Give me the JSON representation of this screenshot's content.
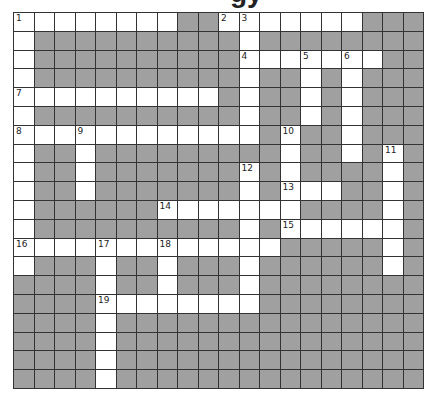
{
  "title": "gy",
  "colors": {
    "block": "#a0a0a0",
    "open": "#ffffff",
    "grid_line": "#333333"
  },
  "grid": {
    "rows": 20,
    "cols": 20,
    "layout": [
      "########..#######...",
      "#..........#........",
      "#..........#######..",
      "#..........#..#.#...",
      "##########.#..#.#...",
      "#..........#..#.#...",
      "############.#..#...",
      "#..#.........#..#.#.",
      "#..#.......#.#....#.",
      "#..#.......#.###..#.",
      "#......#######....#.",
      "#..........#.######.",
      "#############.....#.",
      "#...#..#...#......#.",
      "....#..#...#........",
      "....########........",
      "....#...............",
      "....#...............",
      "....#...............",
      "....#..............."
    ],
    "numbers": [
      {
        "row": 0,
        "col": 0,
        "n": "1"
      },
      {
        "row": 0,
        "col": 10,
        "n": "2"
      },
      {
        "row": 0,
        "col": 11,
        "n": "3"
      },
      {
        "row": 2,
        "col": 11,
        "n": "4"
      },
      {
        "row": 2,
        "col": 14,
        "n": "5"
      },
      {
        "row": 2,
        "col": 16,
        "n": "6"
      },
      {
        "row": 4,
        "col": 0,
        "n": "7"
      },
      {
        "row": 6,
        "col": 0,
        "n": "8"
      },
      {
        "row": 6,
        "col": 3,
        "n": "9"
      },
      {
        "row": 6,
        "col": 13,
        "n": "10"
      },
      {
        "row": 7,
        "col": 18,
        "n": "11"
      },
      {
        "row": 8,
        "col": 11,
        "n": "12"
      },
      {
        "row": 9,
        "col": 13,
        "n": "13"
      },
      {
        "row": 10,
        "col": 7,
        "n": "14"
      },
      {
        "row": 11,
        "col": 13,
        "n": "15"
      },
      {
        "row": 12,
        "col": 0,
        "n": "16"
      },
      {
        "row": 12,
        "col": 4,
        "n": "17"
      },
      {
        "row": 12,
        "col": 7,
        "n": "18"
      },
      {
        "row": 15,
        "col": 4,
        "n": "19"
      }
    ]
  }
}
